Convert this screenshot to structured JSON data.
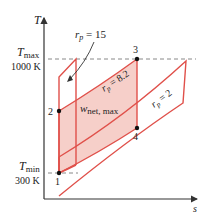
{
  "diagram": {
    "type": "T-s diagram (Brayton cycle, pressure ratio comparison)",
    "axes": {
      "y_label": "T",
      "x_label": "s"
    },
    "temperature_levels": {
      "t_max_label": "T",
      "t_max_sub": "max",
      "t_max_value": "1000 K",
      "t_min_label": "T",
      "t_min_sub": "min",
      "t_min_value": "300 K"
    },
    "points": [
      {
        "id": "1",
        "label": "1"
      },
      {
        "id": "2",
        "label": "2"
      },
      {
        "id": "3",
        "label": "3"
      },
      {
        "id": "4",
        "label": "4"
      }
    ],
    "cycles": [
      {
        "name": "rp-15",
        "label_r": "r",
        "label_sub": "p",
        "label_rest": " = 15"
      },
      {
        "name": "rp-8.2",
        "label_r": "r",
        "label_sub": "p",
        "label_rest": " = 8.2"
      },
      {
        "name": "rp-2",
        "label_r": "r",
        "label_sub": "p",
        "label_rest": " = 2"
      }
    ],
    "area_label": {
      "main": "w",
      "sub": "net, max"
    },
    "colors": {
      "cycle_line": "#e0504a",
      "shade_fill": "#f6cfc9",
      "axis": "#333333",
      "dashed": "#888888",
      "point": "#111111"
    }
  }
}
